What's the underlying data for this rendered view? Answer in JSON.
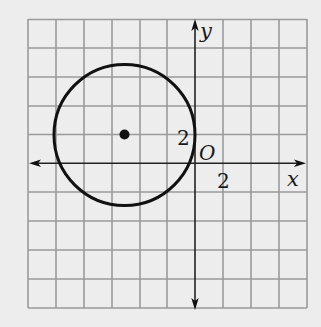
{
  "figure": {
    "type": "coordinate-plane-circle",
    "background": "#ededed",
    "grid_color": "#9a9a9a",
    "ink_color": "#111111",
    "axes": {
      "x_label": "x",
      "y_label": "y",
      "origin_label": "O",
      "x_tick_label": "2",
      "y_tick_label": "2",
      "units_per_cell": 2
    },
    "grid": {
      "columns": 10,
      "rows": 10,
      "x_range": [
        -12,
        8
      ],
      "y_range": [
        -10,
        10
      ]
    },
    "circle": {
      "center": [
        -5,
        2
      ],
      "radius": 5,
      "center_marked": true
    }
  }
}
